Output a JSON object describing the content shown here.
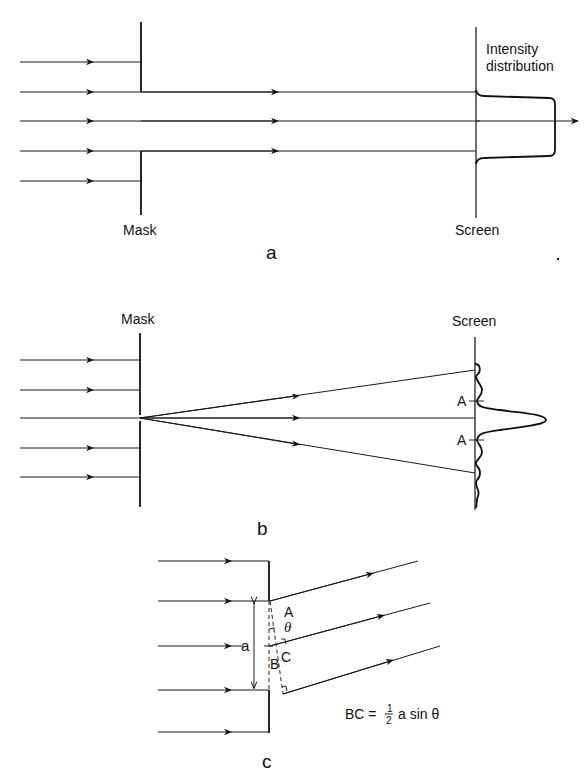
{
  "figure": {
    "panel_a": {
      "caption": "a",
      "mask_label": "Mask",
      "screen_label": "Screen",
      "intensity_label_line1": "Intensity",
      "intensity_label_line2": "distribution"
    },
    "panel_b": {
      "caption": "b",
      "mask_label": "Mask",
      "screen_label": "Screen",
      "marker_upper": "A",
      "marker_lower": "A"
    },
    "panel_c": {
      "caption": "c",
      "width_label": "a",
      "point_A": "A",
      "point_B": "B",
      "point_C": "C",
      "angle_label": "θ",
      "equation_lhs": "BC =",
      "equation_frac_num": "1",
      "equation_frac_den": "2",
      "equation_rhs": "a sin θ"
    }
  }
}
